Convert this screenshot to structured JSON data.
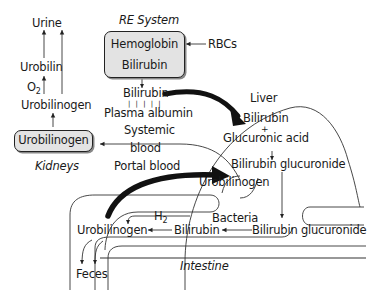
{
  "nodes": {
    "urine": "Urine",
    "urobilin": "Urobilin",
    "o2": "O",
    "o2_sub": "2",
    "urobilinogen_kidney_up": "Urobilinogen",
    "urobilinogen_kidney_box": "Urobilinogen",
    "kidneys": "Kidneys",
    "re_system": "RE System",
    "hemoglobin": "Hemoglobin",
    "bilirubin_re": "Bilirubin",
    "rbcs": "RBCs",
    "bilirubin_plasma": "Bilirubin",
    "albumin_ticks": "| | | | |",
    "plasma_albumin": "Plasma albumin",
    "systemic": "Systemic",
    "blood": "blood",
    "portal_blood": "Portal blood",
    "liver": "Liver",
    "bilirubin_liver": "Bilirubin",
    "plus": "+",
    "glucuronic_acid": "Glucuronic acid",
    "bilirubin_glucuronide_liver": "Bilirubin glucuronide",
    "urobilinogen_portal": "Urobilinogen",
    "h2": "H",
    "h2_sub": "2",
    "bacteria": "Bacteria",
    "urobilinogen_intestine": "Urobilinogen",
    "bilirubin_intestine": "Bilirubin",
    "bilirubin_glucuronide_intestine": "Bilirubin glucuronide",
    "intestine": "Intestine",
    "feces": "Feces"
  },
  "colors": {
    "box_fill": "#e3e3e3",
    "line": "#222222",
    "thick_arrow": "#111111"
  }
}
